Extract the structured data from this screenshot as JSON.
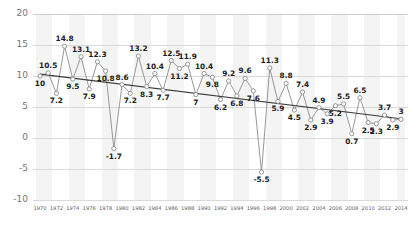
{
  "chart_data": {
    "type": "line",
    "title": "",
    "subtitle": "",
    "xlabel": "",
    "ylabel": "",
    "ylim": [
      -10,
      20
    ],
    "yticks": [
      20,
      15,
      10,
      5,
      0,
      -5,
      -10
    ],
    "grid": true,
    "legend": "none",
    "x": [
      1970,
      1971,
      1972,
      1973,
      1974,
      1975,
      1976,
      1977,
      1978,
      1979,
      1980,
      1981,
      1982,
      1983,
      1984,
      1985,
      1986,
      1987,
      1988,
      1989,
      1990,
      1991,
      1992,
      1993,
      1994,
      1995,
      1996,
      1997,
      1998,
      1999,
      2000,
      2001,
      2002,
      2003,
      2004,
      2005,
      2006,
      2007,
      2008,
      2009,
      2010,
      2011,
      2012,
      2013,
      2014
    ],
    "xtick_labels": [
      "1970",
      "1972",
      "1974",
      "1976",
      "1978",
      "1980",
      "1982",
      "1984",
      "1986",
      "1988",
      "1990",
      "1992",
      "1994",
      "1996",
      "1998",
      "2000",
      "2002",
      "2004",
      "2006",
      "2008",
      "2010",
      "2012",
      "2014"
    ],
    "xticks": [
      1970,
      1972,
      1974,
      1976,
      1978,
      1980,
      1982,
      1984,
      1986,
      1988,
      1990,
      1992,
      1994,
      1996,
      1998,
      2000,
      2002,
      2004,
      2006,
      2008,
      2010,
      2012,
      2014
    ],
    "series": [
      {
        "name": "value",
        "marker": "circle-open",
        "color": "#8c8c8c",
        "values": [
          10,
          10.5,
          7.2,
          14.8,
          9.5,
          13.1,
          7.9,
          12.3,
          10.8,
          -1.7,
          8.6,
          7.2,
          13.2,
          8.3,
          10.4,
          7.7,
          12.5,
          11.2,
          11.9,
          7,
          10.4,
          9.8,
          6.2,
          9.2,
          6.8,
          9.6,
          7.6,
          -5.5,
          11.3,
          5.9,
          8.8,
          4.5,
          7.4,
          2.9,
          4.9,
          3.9,
          5.2,
          5.5,
          0.7,
          6.5,
          2.5,
          2.3,
          3.7,
          2.9,
          3
        ],
        "point_labels": [
          "10",
          "10.5",
          "7.2",
          "14.8",
          "9.5",
          "13.1",
          "7.9",
          "12.3",
          "10.8",
          "-1.7",
          "8.6",
          "7.2",
          "13.2",
          "8.3",
          "10.4",
          "7.7",
          "12.5",
          "11.2",
          "11.9",
          "7",
          "10.4",
          "9.8",
          "6.2",
          "9.2",
          "6.8",
          "9.6",
          "7.6",
          "-5.5",
          "11.3",
          "5.9",
          "8.8",
          "4.5",
          "7.4",
          "2.9",
          "4.9",
          "3.9",
          "5.2",
          "5.5",
          "0.7",
          "6.5",
          "2.5",
          "2.3",
          "3.7",
          "2.9",
          "3"
        ]
      },
      {
        "name": "trend",
        "marker": "none",
        "color": "#3b3b3b",
        "trend_start": 10.3,
        "trend_end": 3.1
      }
    ]
  },
  "colors": {
    "background": "#ffffff",
    "band": "#f4f4f4",
    "grid": "#d9d9d9",
    "line": "#8c8c8c",
    "trend": "#3b3b3b",
    "axis_text": "#767676",
    "label_text": "#1c1c1c"
  }
}
